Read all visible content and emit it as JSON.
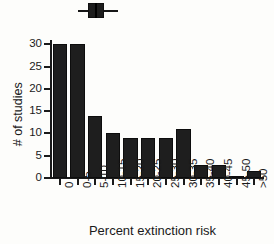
{
  "chart_data": {
    "type": "bar",
    "title": "",
    "subtitle": "",
    "xlabel": "Percent extinction risk",
    "ylabel": "# of studies",
    "categories": [
      "0",
      "0-5",
      "5-10",
      "10-15",
      "15-20",
      "20-25",
      "25-30",
      "30-35",
      "35-40",
      "40-45",
      "45-50",
      ">50"
    ],
    "values": [
      30,
      30,
      14,
      10,
      9,
      9,
      9,
      11,
      3,
      3,
      0.5,
      1.5
    ],
    "ylim": [
      0,
      31
    ],
    "yticks": [
      0,
      5,
      10,
      15,
      20,
      25,
      30
    ],
    "ytick_labels": [
      "0",
      "5",
      "10",
      "15",
      "20",
      "25",
      "30"
    ],
    "grid": false,
    "legend": "none",
    "bar_color": "#1e1e1e",
    "axis_color": "#1a1a1a",
    "annotations": [
      {
        "name": "summary-boxplot",
        "type": "boxplot",
        "orientation": "horizontal",
        "position": "top",
        "whisker_low": 1.5,
        "box_low": 3.0,
        "median": 4.0,
        "box_high": 5.5,
        "whisker_high": 7.5
      }
    ]
  },
  "axes": {
    "y_title": "# of studies",
    "x_title": "Percent extinction risk"
  }
}
